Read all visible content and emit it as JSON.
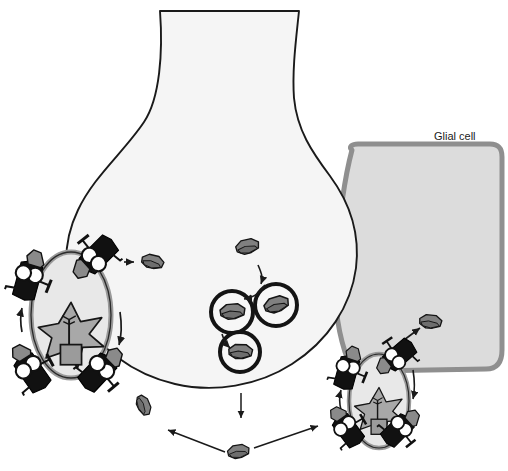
{
  "figure": {
    "background_color": "#ffffff"
  },
  "labels": {
    "glial_cell": "Glial cell",
    "top_caption": ""
  },
  "colors": {
    "outline": "#1a1a1a",
    "terminal_fill": "#f5f5f5",
    "glial_fill": "#dcdcdc",
    "glial_border": "#8f8f8f",
    "cargo_gray": "#808080",
    "cargo_dark": "#6e6e6e",
    "vehicle_black": "#111111",
    "wheel_white": "#ffffff",
    "star_fill": "#a8a8a8",
    "oval_fill": "#e6e6e6",
    "oval_ring": "#9a9a9a",
    "arrow": "#1a1a1a"
  },
  "terminal": {
    "name": "presynaptic-axon-terminal",
    "neck_top_y": 10,
    "bulb_center": {
      "x": 215,
      "y": 245
    }
  },
  "glial_cell": {
    "name": "glial-cell-region",
    "bounds": {
      "x": 340,
      "y": 145,
      "w": 165,
      "h": 230
    }
  },
  "vesicles": [
    {
      "id": "vesicle-1",
      "cx": 232,
      "cy": 312,
      "r": 21
    },
    {
      "id": "vesicle-2",
      "cx": 276,
      "cy": 305,
      "r": 21
    },
    {
      "id": "vesicle-3",
      "cx": 240,
      "cy": 352,
      "r": 20
    }
  ],
  "free_cargo": [
    {
      "id": "cargo-free-left",
      "cx": 152,
      "cy": 262
    },
    {
      "id": "cargo-free-top",
      "cx": 247,
      "cy": 247
    },
    {
      "id": "cargo-glial",
      "cx": 430,
      "cy": 322
    },
    {
      "id": "cargo-bottom-left",
      "cx": 143,
      "cy": 405
    },
    {
      "id": "cargo-bottom-mid",
      "cx": 238,
      "cy": 452
    }
  ],
  "synapses": [
    {
      "id": "synapse-left",
      "name": "left-synapse-oval",
      "cx": 71,
      "cy": 315,
      "rx": 39,
      "ry": 62,
      "star": {
        "cx": 71,
        "cy": 335,
        "r": 30
      }
    },
    {
      "id": "synapse-right",
      "name": "right-synapse-oval",
      "cx": 379,
      "cy": 401,
      "rx": 29,
      "ry": 46,
      "star": {
        "cx": 379,
        "cy": 412,
        "r": 23
      }
    }
  ],
  "vehicles": [
    {
      "id": "truck-left-top",
      "x": 98,
      "y": 255,
      "rot": -38
    },
    {
      "id": "truck-left-upper",
      "x": 28,
      "y": 280,
      "rot": 112
    },
    {
      "id": "truck-left-lower",
      "x": 32,
      "y": 372,
      "rot": 62
    },
    {
      "id": "truck-left-bottom",
      "x": 98,
      "y": 372,
      "rot": 140
    },
    {
      "id": "truck-right-top",
      "x": 399,
      "y": 355,
      "rot": -34
    },
    {
      "id": "truck-right-upper",
      "x": 347,
      "y": 372,
      "rot": 116
    },
    {
      "id": "truck-right-lower",
      "x": 348,
      "y": 430,
      "rot": 60
    },
    {
      "id": "truck-right-bottom",
      "x": 398,
      "y": 430,
      "rot": 142
    }
  ],
  "arrows": [
    {
      "id": "arrow-left-exit",
      "kind": "straight"
    },
    {
      "id": "arrow-vesicle-a",
      "kind": "curved"
    },
    {
      "id": "arrow-vesicle-b",
      "kind": "curved"
    },
    {
      "id": "arrow-vesicle-c",
      "kind": "curved"
    },
    {
      "id": "arrow-down-center",
      "kind": "straight"
    },
    {
      "id": "arrow-bottom-left",
      "kind": "straight"
    },
    {
      "id": "arrow-bottom-right",
      "kind": "straight"
    },
    {
      "id": "arrow-to-glial",
      "kind": "straight"
    },
    {
      "id": "arrow-left-cycle-down",
      "kind": "curved"
    },
    {
      "id": "arrow-left-cycle-up",
      "kind": "curved"
    },
    {
      "id": "arrow-right-cycle-down",
      "kind": "curved"
    },
    {
      "id": "arrow-right-cycle-up",
      "kind": "curved"
    }
  ]
}
